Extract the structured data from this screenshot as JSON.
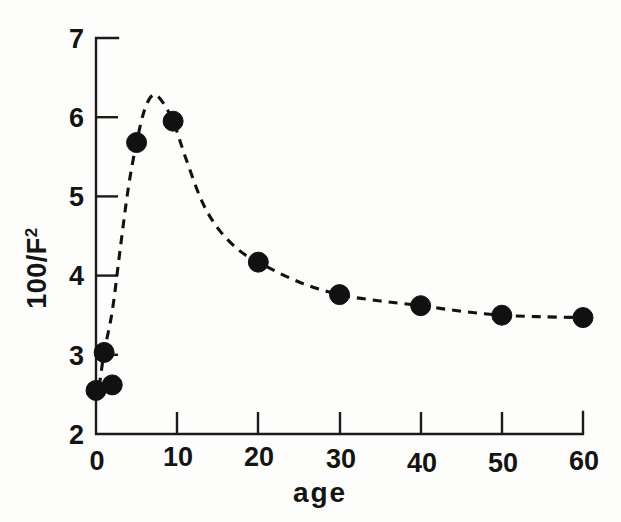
{
  "figure": {
    "background_color": "#fdfdfc",
    "ink_color": "#121212"
  },
  "chart_data": {
    "type": "scatter",
    "title": "",
    "subtitle": "",
    "xlabel": "age",
    "ylabel": "100/F²",
    "ylabel_base": "100/F",
    "ylabel_exponent": "2",
    "xlim": [
      0,
      60
    ],
    "ylim": [
      2,
      7
    ],
    "grid": false,
    "legend": null,
    "legend_position": "none",
    "xticks": [
      0,
      10,
      20,
      30,
      40,
      50,
      60
    ],
    "xticklabels": [
      "0",
      "10",
      "20",
      "30",
      "40",
      "50",
      "60"
    ],
    "yticks": [
      2,
      3,
      4,
      5,
      6,
      7
    ],
    "yticklabels": [
      "2",
      "3",
      "4",
      "5",
      "6",
      "7"
    ],
    "tick_direction": "in",
    "x": [
      0,
      1,
      2,
      5,
      9.5,
      20,
      30,
      40,
      50,
      60
    ],
    "y": [
      2.55,
      3.03,
      2.62,
      5.68,
      5.95,
      4.17,
      3.76,
      3.62,
      3.5,
      3.47
    ],
    "series": [
      {
        "name": "100/F²",
        "marker": "filled-circle",
        "marker_color": "#111111",
        "marker_size": 13,
        "linestyle": "dashed",
        "line_color": "#121212",
        "points": [
          {
            "x": 0,
            "y": 2.55
          },
          {
            "x": 1,
            "y": 3.03
          },
          {
            "x": 2,
            "y": 2.62
          },
          {
            "x": 5,
            "y": 5.68
          },
          {
            "x": 9.5,
            "y": 5.95
          },
          {
            "x": 20,
            "y": 4.17
          },
          {
            "x": 30,
            "y": 3.76
          },
          {
            "x": 40,
            "y": 3.62
          },
          {
            "x": 50,
            "y": 3.5
          },
          {
            "x": 60,
            "y": 3.47
          }
        ]
      }
    ],
    "fitted_curve": {
      "linestyle": "dashed",
      "description": "smooth interpolating curve rising steeply from the origin, peaking near age 7 and decaying toward an asymptote",
      "peak": {
        "x": 7,
        "y": 6.28
      },
      "asymptote": 3.45,
      "points": [
        {
          "x": 0.4,
          "y": 2.6
        },
        {
          "x": 1.0,
          "y": 3.03
        },
        {
          "x": 2.0,
          "y": 3.55
        },
        {
          "x": 3.0,
          "y": 4.35
        },
        {
          "x": 4.0,
          "y": 5.12
        },
        {
          "x": 5.0,
          "y": 5.68
        },
        {
          "x": 6.0,
          "y": 6.1
        },
        {
          "x": 7.0,
          "y": 6.28
        },
        {
          "x": 8.0,
          "y": 6.22
        },
        {
          "x": 9.5,
          "y": 5.95
        },
        {
          "x": 11.0,
          "y": 5.5
        },
        {
          "x": 13.0,
          "y": 4.95
        },
        {
          "x": 15.0,
          "y": 4.6
        },
        {
          "x": 17.5,
          "y": 4.33
        },
        {
          "x": 20.0,
          "y": 4.17
        },
        {
          "x": 25.0,
          "y": 3.92
        },
        {
          "x": 30.0,
          "y": 3.76
        },
        {
          "x": 35.0,
          "y": 3.68
        },
        {
          "x": 40.0,
          "y": 3.62
        },
        {
          "x": 45.0,
          "y": 3.55
        },
        {
          "x": 50.0,
          "y": 3.5
        },
        {
          "x": 55.0,
          "y": 3.48
        },
        {
          "x": 60.0,
          "y": 3.47
        }
      ]
    }
  }
}
